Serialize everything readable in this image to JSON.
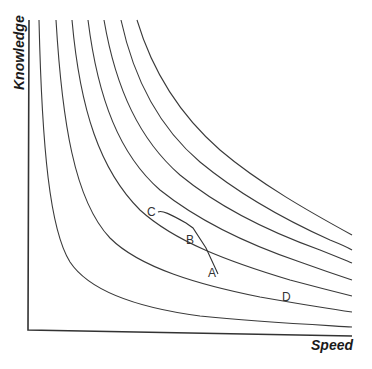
{
  "diagram": {
    "type": "indifference-curves",
    "x_axis_label": "Speed",
    "y_axis_label": "Knowledge",
    "curve_count": 7,
    "point_labels": {
      "a": "A",
      "b": "B",
      "c": "C",
      "d": "D"
    },
    "stroke_color": "#333333",
    "background": "#ffffff"
  }
}
